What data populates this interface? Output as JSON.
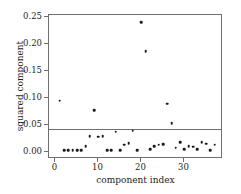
{
  "chart_data": {
    "type": "scatter",
    "title": "",
    "xlabel": "component index",
    "ylabel": "squared component",
    "xlim": [
      -1.5,
      38.5
    ],
    "ylim": [
      -0.012,
      0.252
    ],
    "grid": false,
    "legend": null,
    "xticks": [
      0,
      10,
      20,
      30
    ],
    "xtick_labels": [
      "0",
      "10",
      "20",
      "30"
    ],
    "yticks": [
      0.0,
      0.05,
      0.1,
      0.15,
      0.2,
      0.25
    ],
    "ytick_labels": [
      "0.00",
      "0.05",
      "0.10",
      "0.15",
      "0.20",
      "0.25"
    ],
    "marker": "square-dot",
    "marker_color": "#1a1a1a",
    "threshold": {
      "value": 0.04,
      "color": "#707070",
      "label": "threshold"
    },
    "x": [
      1,
      2,
      3,
      4,
      5,
      6,
      7,
      8,
      9,
      10,
      11,
      12,
      13,
      14,
      15,
      16,
      17,
      18,
      19,
      20,
      21,
      22,
      23,
      24,
      25,
      26,
      27,
      28,
      29,
      30,
      31,
      32,
      33,
      34,
      35,
      36,
      37
    ],
    "y": [
      0.093,
      0.001,
      0.001,
      0.001,
      0.001,
      0.001,
      0.008,
      0.027,
      0.075,
      0.026,
      0.027,
      0.001,
      0.001,
      0.035,
      0.001,
      0.011,
      0.014,
      0.037,
      0.001,
      0.239,
      0.185,
      0.002,
      0.008,
      0.011,
      0.012,
      0.087,
      0.051,
      0.005,
      0.015,
      0.002,
      0.008,
      0.007,
      0.003,
      0.016,
      0.013,
      0.001,
      0.011
    ],
    "series_name": "squared component"
  },
  "axes": {
    "x_title": "component index",
    "y_title": "squared component"
  }
}
